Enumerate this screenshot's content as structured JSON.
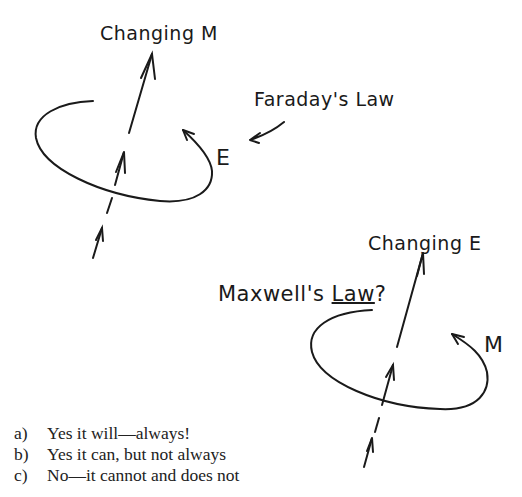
{
  "diagram": {
    "top": {
      "label": "Changing M",
      "law_label": "Faraday's Law",
      "loop_label": "E"
    },
    "bottom": {
      "label": "Changing E",
      "law_label_prefix": "Maxwell's ",
      "law_label_underlined": "Law",
      "law_label_suffix": "?",
      "loop_label": "M"
    }
  },
  "options": [
    {
      "key": "a)",
      "text": "Yes it will—always!"
    },
    {
      "key": "b)",
      "text": "Yes it can, but not always"
    },
    {
      "key": "c)",
      "text": "No—it cannot and does not"
    }
  ],
  "colors": {
    "ink": "#1a1a1a",
    "background": "#ffffff"
  }
}
